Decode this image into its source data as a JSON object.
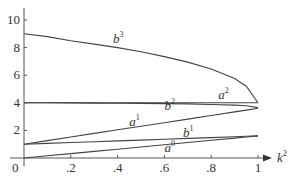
{
  "chart_data": {
    "type": "line",
    "title": "",
    "xlabel": "k²",
    "ylabel": "",
    "xlim": [
      0,
      1
    ],
    "ylim": [
      0,
      10.8
    ],
    "grid": false,
    "legend": "inline curve labels",
    "x_ticks": [
      ".2",
      ".4",
      ".6",
      ".8",
      "1"
    ],
    "x_origin_label": "0",
    "y_ticks": [
      "2",
      "4",
      "6",
      "8",
      "10"
    ],
    "x": [
      0,
      0.1,
      0.2,
      0.3,
      0.4,
      0.5,
      0.6,
      0.7,
      0.8,
      0.9,
      0.95,
      1.0
    ],
    "series": [
      {
        "name": "b³",
        "label_base": "b",
        "label_sup": "3",
        "values": [
          9.0,
          8.8,
          8.5,
          8.25,
          8.0,
          7.7,
          7.35,
          6.95,
          6.45,
          5.75,
          5.2,
          4.0
        ]
      },
      {
        "name": "a²",
        "label_base": "a",
        "label_sup": "2",
        "values": [
          4.0,
          4.0,
          4.0,
          4.0,
          4.0,
          4.0,
          4.0,
          4.0,
          4.0,
          4.0,
          4.0,
          4.0
        ]
      },
      {
        "name": "b²",
        "label_base": "b",
        "label_sup": "2",
        "values": [
          4.0,
          4.0,
          3.99,
          3.98,
          3.97,
          3.96,
          3.94,
          3.92,
          3.88,
          3.83,
          3.78,
          3.65
        ]
      },
      {
        "name": "a¹",
        "label_base": "a",
        "label_sup": "1",
        "values": [
          1.0,
          1.26,
          1.52,
          1.78,
          2.04,
          2.3,
          2.56,
          2.82,
          3.08,
          3.34,
          3.47,
          3.6
        ]
      },
      {
        "name": "b¹",
        "label_base": "b",
        "label_sup": "1",
        "values": [
          1.0,
          1.06,
          1.12,
          1.18,
          1.24,
          1.3,
          1.36,
          1.42,
          1.48,
          1.54,
          1.57,
          1.6
        ]
      },
      {
        "name": "a⁰",
        "label_base": "a",
        "label_sup": "0",
        "values": [
          0.0,
          0.16,
          0.32,
          0.48,
          0.64,
          0.8,
          0.96,
          1.12,
          1.28,
          1.44,
          1.52,
          1.6
        ]
      }
    ],
    "label_positions": {
      "b³": [
        0.38,
        8.3
      ],
      "a²": [
        0.83,
        4.25
      ],
      "b²": [
        0.6,
        3.45
      ],
      "a¹": [
        0.45,
        2.35
      ],
      "b¹": [
        0.68,
        1.55
      ],
      "a⁰": [
        0.6,
        0.4
      ]
    }
  }
}
